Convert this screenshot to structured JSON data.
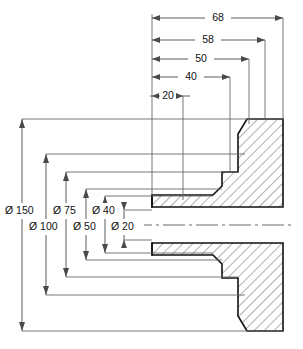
{
  "drawing": {
    "title": "Flanged bush sectional view",
    "type": "engineering-cross-section",
    "background_color": "#ffffff",
    "line_color": "#111111",
    "dimension_color": "#4a4a4a",
    "diameter_symbol": "Ø",
    "horizontal_dimensions": [
      {
        "id": "dim-68",
        "label": "68",
        "value": 68,
        "y": 18,
        "x_start": 152,
        "x_end": 283
      },
      {
        "id": "dim-58",
        "label": "58",
        "value": 58,
        "y": 40,
        "x_start": 152,
        "x_end": 265
      },
      {
        "id": "dim-50",
        "label": "50",
        "value": 50,
        "y": 59,
        "x_start": 152,
        "x_end": 249
      },
      {
        "id": "dim-40",
        "label": "40",
        "value": 40,
        "y": 77,
        "x_start": 152,
        "x_end": 230
      },
      {
        "id": "dim-20",
        "label": "20",
        "value": 20,
        "y": 96,
        "x_start": 152,
        "x_end": 183
      }
    ],
    "diameter_dimensions": [
      {
        "id": "dim-d150",
        "label": "Ø 150",
        "value": 150,
        "x": 22,
        "y_top": 119,
        "y_bottom": 331,
        "text_x": 8,
        "text_y": 211
      },
      {
        "id": "dim-d100",
        "label": "Ø 100",
        "value": 100,
        "x": 46,
        "y_top": 154,
        "y_bottom": 295,
        "text_x": 32,
        "text_y": 227
      },
      {
        "id": "dim-d75",
        "label": "Ø 75",
        "value": 75,
        "x": 66,
        "y_top": 172,
        "y_bottom": 277,
        "text_x": 56,
        "text_y": 211
      },
      {
        "id": "dim-d50",
        "label": "Ø 50",
        "value": 50,
        "x": 86,
        "y_top": 189,
        "y_bottom": 260,
        "text_x": 76,
        "text_y": 227
      },
      {
        "id": "dim-d40",
        "label": "Ø 40",
        "value": 40,
        "x": 105,
        "y_top": 196,
        "y_bottom": 253,
        "text_x": 96,
        "text_y": 211
      },
      {
        "id": "dim-d20",
        "label": "Ø 20",
        "value": 20,
        "x": 124,
        "y_top": 210,
        "y_bottom": 240,
        "text_x": 114,
        "text_y": 227
      }
    ],
    "centerline": {
      "id": "part-centerline",
      "y": 225,
      "x_start": 130,
      "x_end": 292
    },
    "part": {
      "centerline_y": 225,
      "bore_x_left": 152,
      "flange_x_outer": 283,
      "outer_radius_y_top": 119,
      "outer_radius_y_bottom": 331
    }
  }
}
